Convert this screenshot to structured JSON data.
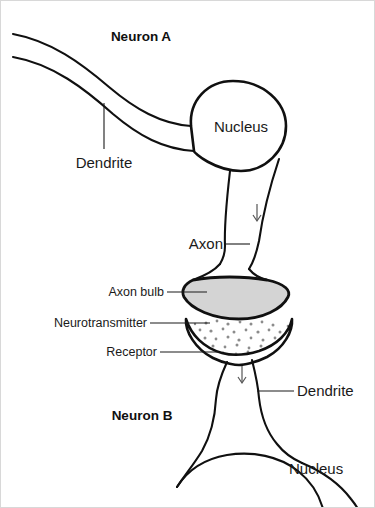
{
  "figure": {
    "background_color": "#ffffff",
    "outline_color": "#101010",
    "bulb_fill_color": "#d4d4d4",
    "neurotransmitter_dot_color": "#8c8c8c",
    "width": 375,
    "height": 508
  },
  "labels": {
    "neuron_a": "Neuron A",
    "neuron_b": "Neuron B",
    "dendrite_top": "Dendrite",
    "nucleus_top": "Nucleus",
    "axon": "Axon",
    "axon_bulb": "Axon bulb",
    "neurotransmitter": "Neurotransmitter",
    "receptor": "Receptor",
    "dendrite_bottom": "Dendrite",
    "nucleus_bottom": "Nucleus"
  },
  "icons": {
    "signal_arrow_axon": "down-arrow-icon",
    "signal_arrow_dendrite": "down-arrow-icon"
  },
  "parts": [
    {
      "name": "dendrite-upper",
      "neuron": "Neuron A",
      "label": "Dendrite"
    },
    {
      "name": "nucleus-upper",
      "neuron": "Neuron A",
      "label": "Nucleus"
    },
    {
      "name": "axon",
      "neuron": "Neuron A",
      "label": "Axon"
    },
    {
      "name": "axon-bulb",
      "neuron": "Neuron A",
      "label": "Axon bulb"
    },
    {
      "name": "neurotransmitter",
      "neuron": "synapse",
      "label": "Neurotransmitter"
    },
    {
      "name": "receptor",
      "neuron": "Neuron B",
      "label": "Receptor"
    },
    {
      "name": "dendrite-lower",
      "neuron": "Neuron B",
      "label": "Dendrite"
    },
    {
      "name": "nucleus-lower",
      "neuron": "Neuron B",
      "label": "Nucleus"
    }
  ]
}
